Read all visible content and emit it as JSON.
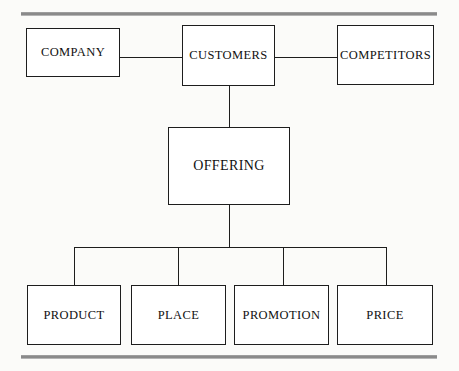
{
  "diagram": {
    "background_color": "#fbfbf9",
    "line_color": "#1d1d1d",
    "rule_color": "#8a8a8a",
    "box_fill": "#ffffff",
    "rules": [
      {
        "name": "top-rule",
        "label": ""
      },
      {
        "name": "bottom-rule",
        "label": ""
      }
    ],
    "nodes": {
      "company": "COMPANY",
      "customers": "CUSTOMERS",
      "competitors": "COMPETITORS",
      "offering": "OFFERING",
      "product": "PRODUCT",
      "place": "PLACE",
      "promotion": "PROMOTION",
      "price": "PRICE"
    },
    "connectors": [
      {
        "name": "company-to-customers",
        "type": "horizontal"
      },
      {
        "name": "customers-to-competitors",
        "type": "horizontal"
      },
      {
        "name": "customers-to-offering",
        "type": "vertical"
      },
      {
        "name": "offering-to-bus",
        "type": "vertical"
      },
      {
        "name": "distribution-bus",
        "type": "horizontal"
      },
      {
        "name": "bus-to-product",
        "type": "vertical"
      },
      {
        "name": "bus-to-place",
        "type": "vertical"
      },
      {
        "name": "bus-to-promotion",
        "type": "vertical"
      },
      {
        "name": "bus-to-price",
        "type": "vertical"
      }
    ]
  }
}
